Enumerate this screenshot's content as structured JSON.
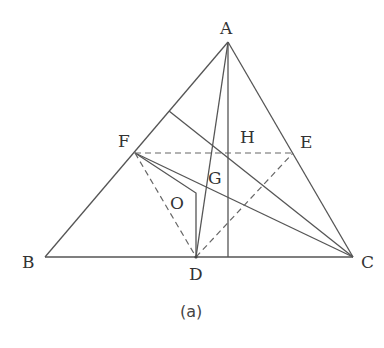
{
  "figure": {
    "caption": "(a)",
    "line_color": "#555555",
    "points": {
      "A": {
        "label": "A",
        "x": 228,
        "y": 42
      },
      "B": {
        "label": "B",
        "x": 45,
        "y": 257
      },
      "C": {
        "label": "C",
        "x": 353,
        "y": 257
      },
      "D": {
        "label": "D",
        "x": 196,
        "y": 257
      },
      "E": {
        "label": "E",
        "x": 293,
        "y": 153
      },
      "F": {
        "label": "F",
        "x": 135,
        "y": 153
      },
      "G": {
        "label": "G"
      },
      "H": {
        "label": "H"
      },
      "O": {
        "label": "O"
      }
    },
    "solid_segments": [
      "AB",
      "AC",
      "BC",
      "AD",
      "A-foot",
      "F-C",
      "P-C",
      "F-Ocorner",
      "Ocorner-D"
    ],
    "dashed_segments": [
      "FE",
      "FD",
      "DE"
    ]
  }
}
